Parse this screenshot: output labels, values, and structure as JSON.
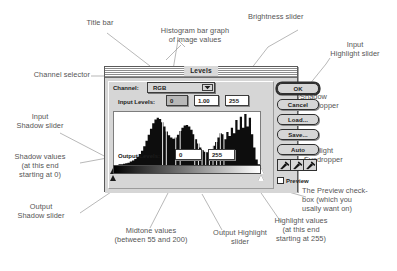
{
  "dialog": {
    "titlebar_text": "Levels",
    "channel": {
      "label": "Channel:",
      "value": "RGB",
      "arrow_icon": "chevron-down-icon"
    },
    "input_levels": {
      "label": "Input Levels:",
      "shadow": "0",
      "midtone": "1.00",
      "highlight": "255"
    },
    "output_levels": {
      "label": "Output Levels:",
      "shadow": "0",
      "highlight": "255"
    },
    "buttons": [
      {
        "name": "ok-button",
        "label": "OK",
        "default": true
      },
      {
        "name": "cancel-button",
        "label": "Cancel",
        "default": false
      },
      {
        "name": "load-button",
        "label": "Load...",
        "default": false
      },
      {
        "name": "save-button",
        "label": "Save...",
        "default": false
      },
      {
        "name": "auto-button",
        "label": "Auto",
        "default": false
      }
    ],
    "eyedroppers": [
      {
        "name": "eyedropper-shadow",
        "icon": "eyedropper-icon"
      },
      {
        "name": "eyedropper-midtone",
        "icon": "eyedropper-icon"
      },
      {
        "name": "eyedropper-highlight",
        "icon": "eyedropper-icon"
      }
    ],
    "preview": {
      "label": "Preview",
      "checked": false
    },
    "sliders": {
      "input_shadow_pos_pct": 0,
      "input_midtone_pos_pct": 50,
      "input_highlight_pos_pct": 100,
      "output_shadow_pos_pct": 0,
      "output_highlight_pos_pct": 100
    }
  },
  "annotations": [
    {
      "name": "annotation-title-bar",
      "text": "Title bar"
    },
    {
      "name": "annotation-histogram",
      "text": "Histogram bar graph\nof image values"
    },
    {
      "name": "annotation-brightness-slider",
      "text": "Brightness slider"
    },
    {
      "name": "annotation-input-highlight-slider",
      "text": "Input\nHighlight slider"
    },
    {
      "name": "annotation-channel-selector",
      "text": "Channel selector"
    },
    {
      "name": "annotation-input-shadow-slider",
      "text": "Input\nShadow slider"
    },
    {
      "name": "annotation-shadow-values",
      "text": "Shadow values\n(at this end\nstarting at 0)"
    },
    {
      "name": "annotation-output-shadow-slider",
      "text": "Output\nShadow slider"
    },
    {
      "name": "annotation-midtone-values",
      "text": "Midtone values\n(between 55 and 200)"
    },
    {
      "name": "annotation-output-highlight-slider",
      "text": "Output Highlight\nslider"
    },
    {
      "name": "annotation-highlight-values",
      "text": "Highlight values\n(at this end\nstarting at 255)"
    },
    {
      "name": "annotation-shadow-eyedropper",
      "text": "Shadow\nEyedropper"
    },
    {
      "name": "annotation-highlight-eyedropper",
      "text": "Highlight\nEyedropper"
    },
    {
      "name": "annotation-preview-checkbox",
      "text": "The Preview check-\nbox (which you\nusally want on)"
    }
  ],
  "colors": {
    "dialog_face": "#d6d6d6",
    "dialog_border": "#5a5a5a",
    "annotation_text": "#555555",
    "leader_line": "#9a9a9a",
    "histogram_fill": "#0d0d0d"
  },
  "chart_data": {
    "type": "bar",
    "title": "",
    "xlabel": "",
    "ylabel": "",
    "xlim": [
      0,
      255
    ],
    "ylim": [
      0,
      100
    ],
    "grid": false,
    "legend": "none",
    "categories": [
      0,
      4,
      8,
      12,
      16,
      20,
      24,
      28,
      32,
      36,
      40,
      44,
      48,
      52,
      56,
      60,
      64,
      68,
      72,
      76,
      80,
      84,
      88,
      92,
      96,
      100,
      104,
      108,
      112,
      116,
      120,
      124,
      128,
      132,
      136,
      140,
      144,
      148,
      152,
      156,
      160,
      164,
      168,
      172,
      176,
      180,
      184,
      188,
      192,
      196,
      200,
      204,
      208,
      212,
      216,
      220,
      224,
      228,
      232,
      236,
      240,
      244,
      248,
      252,
      255
    ],
    "values": [
      2,
      2,
      3,
      3,
      4,
      5,
      6,
      8,
      10,
      13,
      17,
      22,
      28,
      36,
      46,
      57,
      68,
      78,
      85,
      88,
      86,
      80,
      72,
      63,
      56,
      52,
      50,
      52,
      57,
      64,
      70,
      74,
      75,
      72,
      66,
      58,
      49,
      41,
      34,
      29,
      26,
      25,
      27,
      31,
      37,
      44,
      52,
      60,
      58,
      49,
      62,
      55,
      70,
      60,
      84,
      66,
      90,
      70,
      95,
      72,
      88,
      58,
      34,
      12,
      3
    ]
  }
}
